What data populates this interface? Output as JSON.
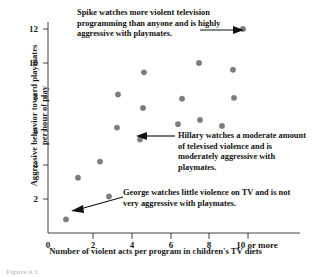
{
  "chart_data": {
    "type": "scatter",
    "title": "",
    "xlabel": "Number of violent acts per program in children's TV diets",
    "ylabel": "Aggressive behavior toward playmates per hour of play",
    "xlim": [
      0,
      10.6
    ],
    "ylim": [
      0,
      12.8
    ],
    "grid": false,
    "legend": "none",
    "xticks": [
      {
        "value": 0,
        "label": "0"
      },
      {
        "value": 2,
        "label": "2"
      },
      {
        "value": 4,
        "label": "4"
      },
      {
        "value": 6,
        "label": "6"
      },
      {
        "value": 8,
        "label": "8"
      },
      {
        "value": 10,
        "label": "10 or more"
      }
    ],
    "yticks": [
      {
        "value": 0,
        "label": "0"
      },
      {
        "value": 2,
        "label": "2"
      },
      {
        "value": 4,
        "label": "4"
      },
      {
        "value": 6,
        "label": "6"
      },
      {
        "value": 8,
        "label": "8"
      },
      {
        "value": 10,
        "label": "10"
      },
      {
        "value": 12,
        "label": "12"
      }
    ],
    "points": [
      {
        "x": 0.9,
        "y": 0.8,
        "name": "George"
      },
      {
        "x": 1.5,
        "y": 3.25
      },
      {
        "x": 2.6,
        "y": 4.2
      },
      {
        "x": 3.05,
        "y": 2.15
      },
      {
        "x": 3.45,
        "y": 6.2
      },
      {
        "x": 3.5,
        "y": 8.15
      },
      {
        "x": 4.6,
        "y": 5.5,
        "name": "Hillary"
      },
      {
        "x": 4.75,
        "y": 7.35
      },
      {
        "x": 4.8,
        "y": 9.45
      },
      {
        "x": 6.5,
        "y": 6.4
      },
      {
        "x": 6.7,
        "y": 7.9
      },
      {
        "x": 7.55,
        "y": 10.0
      },
      {
        "x": 7.6,
        "y": 6.65
      },
      {
        "x": 8.7,
        "y": 6.3
      },
      {
        "x": 9.25,
        "y": 9.6
      },
      {
        "x": 9.3,
        "y": 7.95
      },
      {
        "x": 9.75,
        "y": 12.0,
        "name": "Spike"
      }
    ],
    "point_color": "#7d7d7d",
    "axis_color": "#2b2b2b"
  },
  "annotations": {
    "spike": "Spike watches more violent television programming than anyone and is highly aggressive with playmates.",
    "hillary": "Hillary watches a moderate amount of televised violence and is moderately aggressive with playmates.",
    "george": "George watches little violence on TV and is not very aggressive with playmates."
  },
  "caption": "Figure 6.1"
}
